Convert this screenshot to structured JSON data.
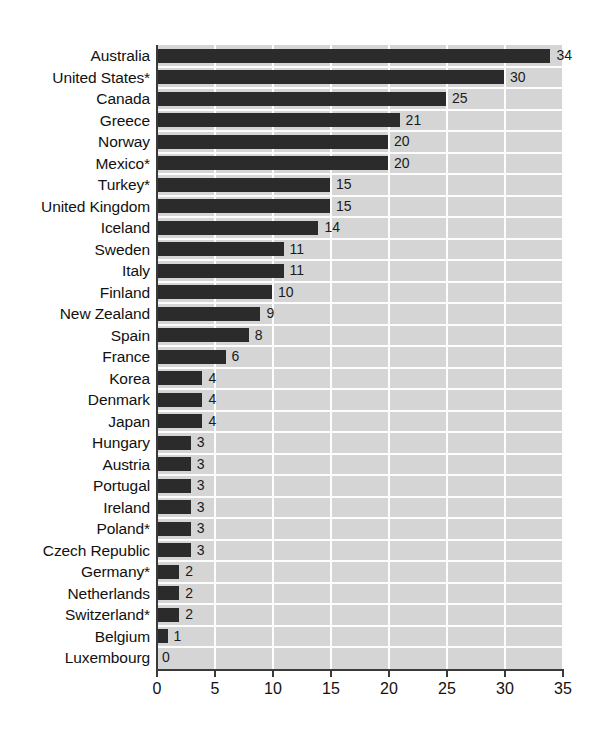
{
  "chart_data": {
    "type": "bar",
    "orientation": "horizontal",
    "title": "",
    "subtitle": "",
    "xlabel": "",
    "ylabel": "",
    "xlim": [
      0,
      35
    ],
    "xticks": [
      0,
      5,
      10,
      15,
      20,
      25,
      30,
      35
    ],
    "xtick_labels": [
      "0",
      "5",
      "10",
      "15",
      "20",
      "25",
      "30",
      "35"
    ],
    "grid": true,
    "grid_orientation": "both",
    "legend": false,
    "categories": [
      "Australia",
      "United States*",
      "Canada",
      "Greece",
      "Norway",
      "Mexico*",
      "Turkey*",
      "United Kingdom",
      "Iceland",
      "Sweden",
      "Italy",
      "Finland",
      "New Zealand",
      "Spain",
      "France",
      "Korea",
      "Denmark",
      "Japan",
      "Hungary",
      "Austria",
      "Portugal",
      "Ireland",
      "Poland*",
      "Czech Republic",
      "Germany*",
      "Netherlands",
      "Switzerland*",
      "Belgium",
      "Luxembourg"
    ],
    "values": [
      34,
      30,
      25,
      21,
      20,
      20,
      15,
      15,
      14,
      11,
      11,
      10,
      9,
      8,
      6,
      4,
      4,
      4,
      3,
      3,
      3,
      3,
      3,
      3,
      2,
      2,
      2,
      1,
      0
    ],
    "value_labels": [
      "34",
      "30",
      "25",
      "21",
      "20",
      "20",
      "15",
      "15",
      "14",
      "11",
      "11",
      "10",
      "9",
      "8",
      "6",
      "4",
      "4",
      "4",
      "3",
      "3",
      "3",
      "3",
      "3",
      "3",
      "2",
      "2",
      "2",
      "1",
      "0"
    ]
  },
  "colors": {
    "bar": "#2b2b2b",
    "plot_background": "#d5d5d5",
    "gridline": "#fdfdfd",
    "axis": "#3a3a3a",
    "text": "#111111",
    "page_background": "#ffffff"
  }
}
